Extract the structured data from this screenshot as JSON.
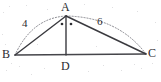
{
  "figure": {
    "type": "geometry-diagram",
    "shape": "triangle-with-cevian",
    "background_color": "#ffffff",
    "stroke_color": "#3a3a3f",
    "arc_color": "#7a7a80",
    "label_color": "#2b2b2f",
    "vertices": [
      {
        "name": "A",
        "label": "A",
        "x": 66,
        "y": 16,
        "label_x": 61,
        "label_y": 1
      },
      {
        "name": "B",
        "label": "B",
        "x": 15,
        "y": 55,
        "label_x": 2,
        "label_y": 48
      },
      {
        "name": "C",
        "label": "C",
        "x": 146,
        "y": 54,
        "label_x": 148,
        "label_y": 47
      },
      {
        "name": "D",
        "label": "D",
        "x": 66,
        "y": 55,
        "label_x": 61,
        "label_y": 60
      }
    ],
    "segments": [
      {
        "name": "AB",
        "from": "A",
        "to": "B",
        "style": "solid"
      },
      {
        "name": "AC",
        "from": "A",
        "to": "C",
        "style": "solid"
      },
      {
        "name": "BC",
        "from": "B",
        "to": "C",
        "style": "solid"
      },
      {
        "name": "AD",
        "from": "A",
        "to": "D",
        "style": "solid"
      }
    ],
    "arcs": [
      {
        "name": "arc-BA",
        "from": "B",
        "to": "A",
        "style": "dotted",
        "bulge": "outward"
      },
      {
        "name": "arc-AC",
        "from": "A",
        "to": "C",
        "style": "dotted",
        "bulge": "outward"
      }
    ],
    "measures": [
      {
        "name": "AB-length",
        "value": "4",
        "x": 22,
        "y": 18
      },
      {
        "name": "AC-length",
        "value": "6",
        "x": 97,
        "y": 16
      }
    ],
    "angle_marks": [
      {
        "name": "angle-BAD-mark",
        "x": 62,
        "y": 24
      },
      {
        "name": "angle-DAC-mark",
        "x": 71,
        "y": 24
      }
    ]
  }
}
